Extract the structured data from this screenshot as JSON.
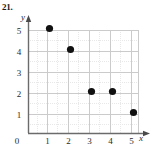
{
  "problem": {
    "number": "21."
  },
  "axes": {
    "x_label": "x",
    "y_label": "y",
    "origin_label": "0",
    "x_ticks": [
      "1",
      "2",
      "3",
      "4",
      "5"
    ],
    "y_ticks": [
      "1",
      "2",
      "3",
      "4",
      "5"
    ]
  },
  "chart_data": {
    "type": "scatter",
    "title": "",
    "xlabel": "x",
    "ylabel": "y",
    "xlim": [
      0,
      5.4
    ],
    "ylim": [
      0,
      5.4
    ],
    "xticks": [
      0,
      1,
      2,
      3,
      4,
      5
    ],
    "yticks": [
      0,
      1,
      2,
      3,
      4,
      5
    ],
    "grid": true,
    "minor_grid": true,
    "legend": null,
    "series": [
      {
        "name": "points",
        "marker": "filled-circle",
        "color": "#111111",
        "points": [
          {
            "x": 1,
            "y": 5
          },
          {
            "x": 2,
            "y": 4
          },
          {
            "x": 3,
            "y": 2
          },
          {
            "x": 4,
            "y": 2
          },
          {
            "x": 5,
            "y": 1
          }
        ]
      }
    ]
  },
  "colors": {
    "axis": "#6b6b6b",
    "major_grid": "#cfcfcf",
    "minor_grid": "#e6e6e6",
    "marker": "#111111",
    "text": "#2a2a2a"
  }
}
